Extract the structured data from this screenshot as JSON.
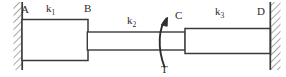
{
  "figure": {
    "type": "torsional-shaft-free-body-diagram",
    "colors": {
      "line": "#3a3a3a",
      "hatch": "#8a8a8a",
      "text": "#2b2b2b",
      "background": "#ffffff"
    },
    "labels": {
      "node_a": "A",
      "node_b": "B",
      "node_c": "C",
      "node_d": "D",
      "stiffness_1": "k",
      "stiffness_1_sub": "1",
      "stiffness_2": "k",
      "stiffness_2_sub": "2",
      "stiffness_3": "k",
      "stiffness_3_sub": "3",
      "torque": "T"
    },
    "elements": {
      "left_wall": "fixed-support-hatched",
      "right_wall": "fixed-support-hatched",
      "segment_ab": "thick-shaft-section",
      "segment_bc": "thin-shaft-section",
      "segment_cd": "medium-shaft-section",
      "torque_arrow": "curved-counterclockwise-arrow"
    }
  }
}
